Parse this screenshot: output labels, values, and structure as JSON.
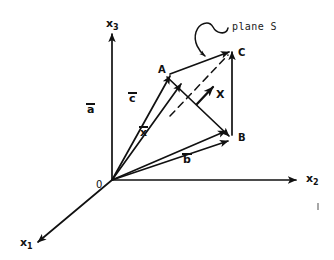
{
  "figure": {
    "kind": "vector-diagram",
    "stroke_color": "#111111",
    "background_color": "#ffffff",
    "axes": [
      {
        "name": "x1",
        "base": "x",
        "subscript": "1",
        "x": 20,
        "y": 237
      },
      {
        "name": "x2",
        "base": "x",
        "subscript": "2",
        "x": 306,
        "y": 173
      },
      {
        "name": "x3",
        "base": "x",
        "subscript": "3",
        "x": 106,
        "y": 18
      }
    ],
    "points": [
      {
        "name": "A",
        "label": "A",
        "x": 158,
        "y": 65
      },
      {
        "name": "B",
        "label": "B",
        "x": 238,
        "y": 133
      },
      {
        "name": "C",
        "label": "C",
        "x": 238,
        "y": 48
      },
      {
        "name": "O",
        "label": "0",
        "x": 96,
        "y": 180
      }
    ],
    "vectors": [
      {
        "name": "a",
        "label": "a",
        "overbar": true,
        "x": 87,
        "y": 103
      },
      {
        "name": "c",
        "label": "c",
        "overbar": true,
        "x": 129,
        "y": 92
      },
      {
        "name": "x",
        "label": "x",
        "overbar": true,
        "x": 140,
        "y": 126
      },
      {
        "name": "b",
        "label": "b",
        "overbar": true,
        "x": 183,
        "y": 153
      }
    ],
    "markers": [
      {
        "name": "X",
        "label": "X",
        "x": 216,
        "y": 89
      }
    ],
    "annotations": [
      {
        "name": "plane-s",
        "label": "plane S",
        "x": 232,
        "y": 22
      }
    ]
  }
}
